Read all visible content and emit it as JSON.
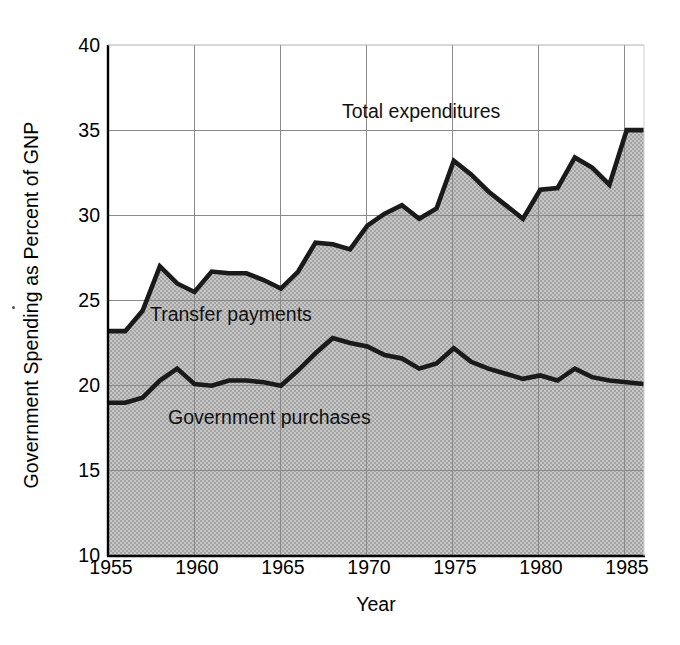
{
  "chart_data": {
    "type": "area",
    "title": "",
    "xlabel": "Year",
    "ylabel": "Government Spending as Percent of GNP",
    "xlim": [
      1955,
      1986
    ],
    "ylim": [
      10,
      40
    ],
    "xticks": [
      1955,
      1960,
      1965,
      1970,
      1975,
      1980,
      1985
    ],
    "yticks": [
      10,
      15,
      20,
      25,
      30,
      35,
      40
    ],
    "grid": true,
    "legend_position": "inline-annotations",
    "annotations": [
      {
        "text": "Total expenditures",
        "x": 1969,
        "y": 36.2
      },
      {
        "text": "Transfer payments",
        "x": 1957.5,
        "y": 23.6
      },
      {
        "text": "Government purchases",
        "x": 1958.5,
        "y": 18.1
      }
    ],
    "x": [
      1955,
      1956,
      1957,
      1958,
      1959,
      1960,
      1961,
      1962,
      1963,
      1964,
      1965,
      1966,
      1967,
      1968,
      1969,
      1970,
      1971,
      1972,
      1973,
      1974,
      1975,
      1976,
      1977,
      1978,
      1979,
      1980,
      1981,
      1982,
      1983,
      1984,
      1985,
      1986
    ],
    "series": [
      {
        "name": "Total expenditures",
        "values": [
          23.2,
          23.2,
          24.4,
          27.0,
          26.0,
          25.5,
          26.7,
          26.6,
          26.6,
          26.2,
          25.7,
          26.7,
          28.4,
          28.3,
          28.0,
          29.4,
          30.1,
          30.6,
          29.8,
          30.4,
          33.2,
          32.4,
          31.4,
          30.6,
          29.8,
          31.5,
          31.6,
          33.4,
          32.8,
          31.8,
          35.0,
          35.0
        ]
      },
      {
        "name": "Government purchases",
        "values": [
          19.0,
          19.0,
          19.3,
          20.3,
          21.0,
          20.1,
          20.0,
          20.3,
          20.3,
          20.2,
          20.0,
          20.9,
          21.9,
          22.8,
          22.5,
          22.3,
          21.8,
          21.6,
          21.0,
          21.3,
          22.2,
          21.4,
          21.0,
          20.7,
          20.4,
          20.6,
          20.3,
          21.0,
          20.5,
          20.3,
          20.2,
          20.1
        ]
      }
    ],
    "bands": [
      {
        "name": "Government purchases",
        "from": 10,
        "to_series": "Government purchases",
        "fill": "#b9b9b9"
      },
      {
        "name": "Transfer payments",
        "from_series": "Government purchases",
        "to_series": "Total expenditures",
        "fill": "#b9b9b9"
      }
    ],
    "colors": {
      "line": "#1a1a1a",
      "fill": "#b9b9b9",
      "grid": "#7a7a7a",
      "axis": "#000000",
      "background": "#ffffff"
    }
  },
  "axis": {
    "x_title": "Year",
    "y_title": "Government Spending as Percent of GNP",
    "x_tick_labels": [
      "1955",
      "1960",
      "1965",
      "1970",
      "1975",
      "1980",
      "1985"
    ],
    "y_tick_labels": [
      "10",
      "15",
      "20",
      "25",
      "30",
      "35",
      "40"
    ]
  },
  "labels": {
    "total": "Total expenditures",
    "transfer": "Transfer payments",
    "purchases": "Government purchases"
  }
}
